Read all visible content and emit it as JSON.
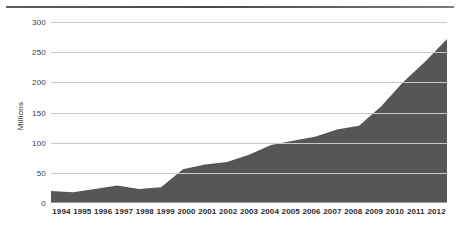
{
  "page": {
    "header_ghost": "",
    "background": "#ffffff"
  },
  "chart_data": {
    "type": "area",
    "title": "",
    "xlabel": "",
    "ylabel": "Millions",
    "categories": [
      "1994",
      "1995",
      "1996",
      "1997",
      "1998",
      "1999",
      "2000",
      "2001",
      "2002",
      "2003",
      "2004",
      "2005",
      "2006",
      "2007",
      "2008",
      "2009",
      "2010",
      "2011",
      "2012"
    ],
    "values": [
      20,
      18,
      23,
      29,
      23,
      26,
      56,
      64,
      68,
      80,
      96,
      103,
      110,
      122,
      128,
      160,
      200,
      234,
      272
    ],
    "series": [
      {
        "name": "Millions",
        "values": [
          20,
          18,
          23,
          29,
          23,
          26,
          56,
          64,
          68,
          80,
          96,
          103,
          110,
          122,
          128,
          160,
          200,
          234,
          272
        ]
      }
    ],
    "ylim": [
      0,
      300
    ],
    "yticks": [
      0,
      50,
      100,
      150,
      200,
      250,
      300
    ],
    "ytick_labels": [
      "0",
      "50",
      "100",
      "150",
      "200",
      "250",
      "300"
    ],
    "grid": true,
    "legend": null,
    "fill_color": "#565656",
    "grid_color": "#c8c8c8",
    "axis_color": "#9a9a9a"
  }
}
